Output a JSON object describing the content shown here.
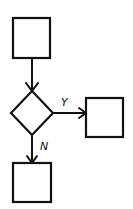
{
  "diagram": {
    "type": "flowchart",
    "nodes": [
      {
        "id": "process-top",
        "shape": "rectangle",
        "label": ""
      },
      {
        "id": "decision",
        "shape": "diamond",
        "label": ""
      },
      {
        "id": "process-yes",
        "shape": "rectangle",
        "label": ""
      },
      {
        "id": "process-no",
        "shape": "rectangle",
        "label": ""
      }
    ],
    "edges": [
      {
        "from": "process-top",
        "to": "decision",
        "label": ""
      },
      {
        "from": "decision",
        "to": "process-yes",
        "label": "Y"
      },
      {
        "from": "decision",
        "to": "process-no",
        "label": "N"
      }
    ],
    "labels": {
      "yes": "Y",
      "no": "N"
    },
    "colors": {
      "stroke": "#111111",
      "background": "#ffffff"
    }
  }
}
